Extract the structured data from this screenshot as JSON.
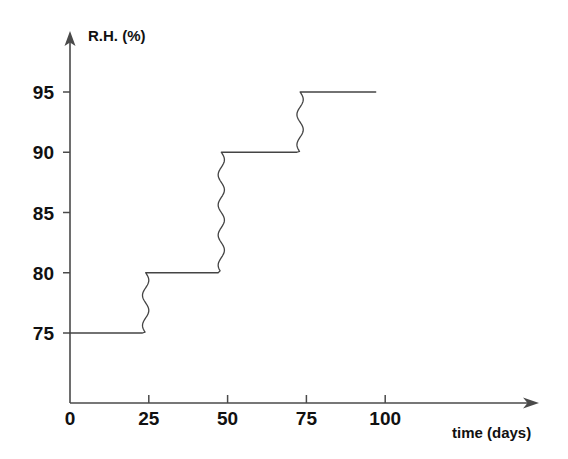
{
  "chart_data": {
    "type": "line",
    "title": "",
    "subtitle": "",
    "xlabel": "time (days)",
    "ylabel": "R.H. (%)",
    "xlim": [
      0,
      110
    ],
    "ylim": [
      70.5,
      97.5
    ],
    "grid": false,
    "legend": "none",
    "xticks": [
      0,
      25,
      50,
      75,
      100
    ],
    "xtick_labels": [
      "0",
      "25",
      "50",
      "75",
      "100"
    ],
    "yticks": [
      75,
      80,
      85,
      90,
      95
    ],
    "ytick_labels": [
      "75",
      "80",
      "85",
      "90",
      "95"
    ],
    "line_style": "step-with-wavy-transitions",
    "line_color": "#444444",
    "line_width": 1.3,
    "annotations": [],
    "steps": [
      {
        "level": 75,
        "x_start": 0,
        "x_end": 23
      },
      {
        "level": 80,
        "x_start": 25,
        "x_end": 47
      },
      {
        "level": 90,
        "x_start": 49,
        "x_end": 72
      },
      {
        "level": 95,
        "x_start": 74,
        "x_end": 97
      }
    ],
    "transitions": [
      {
        "from_level": 75,
        "to_level": 80,
        "x_start": 23,
        "x_end": 25,
        "wave_cycles": 2
      },
      {
        "from_level": 80,
        "to_level": 90,
        "x_start": 47,
        "x_end": 49,
        "wave_cycles": 4
      },
      {
        "from_level": 90,
        "to_level": 95,
        "x_start": 72,
        "x_end": 74,
        "wave_cycles": 2
      }
    ],
    "x": [
      0,
      23,
      25,
      47,
      49,
      72,
      74,
      97
    ],
    "y": [
      75,
      75,
      80,
      80,
      90,
      90,
      95,
      95
    ],
    "series": [
      {
        "name": "R.H. (%)",
        "values": [
          75,
          75,
          80,
          80,
          90,
          90,
          95,
          95
        ]
      }
    ]
  },
  "axes": {
    "y_axis_title": "R.H. (%)",
    "x_axis_title": "time (days)",
    "y_arrow": "up-arrow-icon",
    "x_arrow": "right-arrow-icon"
  },
  "geometry": {
    "origin_x": 70,
    "origin_y": 403,
    "x_per_day": 3.152,
    "y_per_percent": 12.05,
    "y_at_75": 333,
    "y_axis_top": 33,
    "x_axis_right": 537
  }
}
